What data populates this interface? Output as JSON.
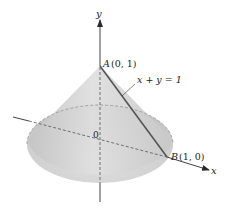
{
  "figure": {
    "axes": {
      "x_label": "x",
      "y_label": "y",
      "origin_label": "0"
    },
    "points": {
      "A": {
        "name": "A",
        "coords": "(0, 1)"
      },
      "B": {
        "name": "B",
        "coords": "(1, 0)"
      }
    },
    "line_label": "x + y = 1",
    "colors": {
      "cone_fill": "#c9c9c9",
      "cone_light": "#ececec",
      "axis": "#2a2a2a",
      "generator_line": "#555555",
      "dashed": "#8a8a8a"
    }
  }
}
